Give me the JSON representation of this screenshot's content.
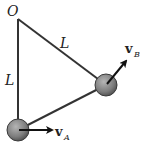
{
  "diagram": {
    "pivot_label": "O",
    "rod_label_1": "L",
    "rod_label_2": "L",
    "vector_A": {
      "symbol": "v",
      "subscript": "A"
    },
    "vector_B": {
      "symbol": "v",
      "subscript": "B"
    },
    "colors": {
      "rod": "#333333",
      "ball_fill": "#8a8a8a",
      "ball_edge": "#3a3a3a",
      "arrow": "#111111",
      "background": "#ffffff"
    }
  }
}
